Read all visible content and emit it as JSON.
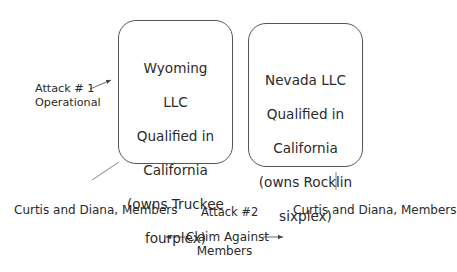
{
  "diagram": {
    "left_entity": {
      "lines": [
        "Wyoming",
        "LLC",
        "Qualified in",
        "California",
        "(owns Truckee",
        "fourplex)"
      ]
    },
    "right_entity": {
      "lines": [
        "Nevada LLC",
        "Qualified in",
        "California",
        "(owns Rocklin",
        "sixplex)"
      ]
    },
    "attack1": {
      "line1": "Attack # 1",
      "line2": "Operational"
    },
    "attack2": {
      "label": "Attack #2"
    },
    "claim": {
      "line1": "Claim Against",
      "line2": "Members"
    },
    "left_members": "Curtis and Diana, Members",
    "right_members": "Curtis and Diana, Members"
  }
}
